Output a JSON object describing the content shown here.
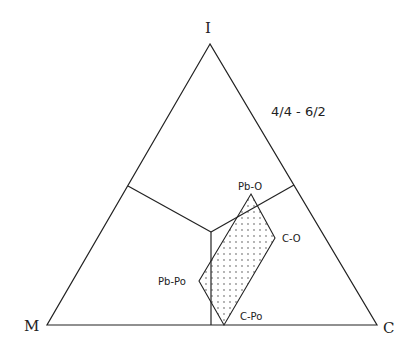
{
  "diagram": {
    "type": "ternary",
    "title": "4/4 - 6/2",
    "vertices": {
      "top": {
        "label": "I",
        "x": 210,
        "y": 44
      },
      "left": {
        "label": "M",
        "x": 47,
        "y": 325
      },
      "right": {
        "label": "C",
        "x": 377,
        "y": 325
      }
    },
    "field_boundaries": {
      "center": {
        "x": 211,
        "y": 232
      },
      "left_edge_point": {
        "x": 128,
        "y": 186
      },
      "right_edge_point": {
        "x": 294,
        "y": 185
      },
      "bottom_edge_point": {
        "x": 211,
        "y": 325
      }
    },
    "region": {
      "fill": "dotted",
      "points": [
        {
          "label": "Pb-O",
          "x": 251,
          "y": 194
        },
        {
          "label": "C-O",
          "x": 275,
          "y": 238
        },
        {
          "label": "C-Po",
          "x": 224,
          "y": 325
        },
        {
          "label": "Pb-Po",
          "x": 199,
          "y": 281
        }
      ]
    },
    "colors": {
      "line": "#222222",
      "background": "#ffffff"
    }
  }
}
